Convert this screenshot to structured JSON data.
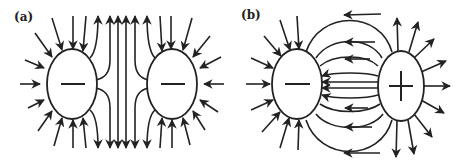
{
  "figure": {
    "panels": [
      {
        "label": "(a)",
        "description": "Electric field lines between two like (negative) charges",
        "charges": [
          {
            "sign": "−",
            "symbol": "minus",
            "cx": 72,
            "cy": 84
          },
          {
            "sign": "−",
            "symbol": "minus",
            "cx": 172,
            "cy": 84
          }
        ],
        "arrow_direction": "inward"
      },
      {
        "label": "(b)",
        "description": "Electric field lines between opposite charges (dipole)",
        "charges": [
          {
            "sign": "−",
            "symbol": "minus",
            "cx": 297,
            "cy": 84
          },
          {
            "sign": "+",
            "symbol": "plus",
            "cx": 401,
            "cy": 86
          }
        ],
        "arrow_direction": "from + to −"
      }
    ],
    "colors": {
      "ink": "#222222",
      "background": "#ffffff"
    }
  }
}
